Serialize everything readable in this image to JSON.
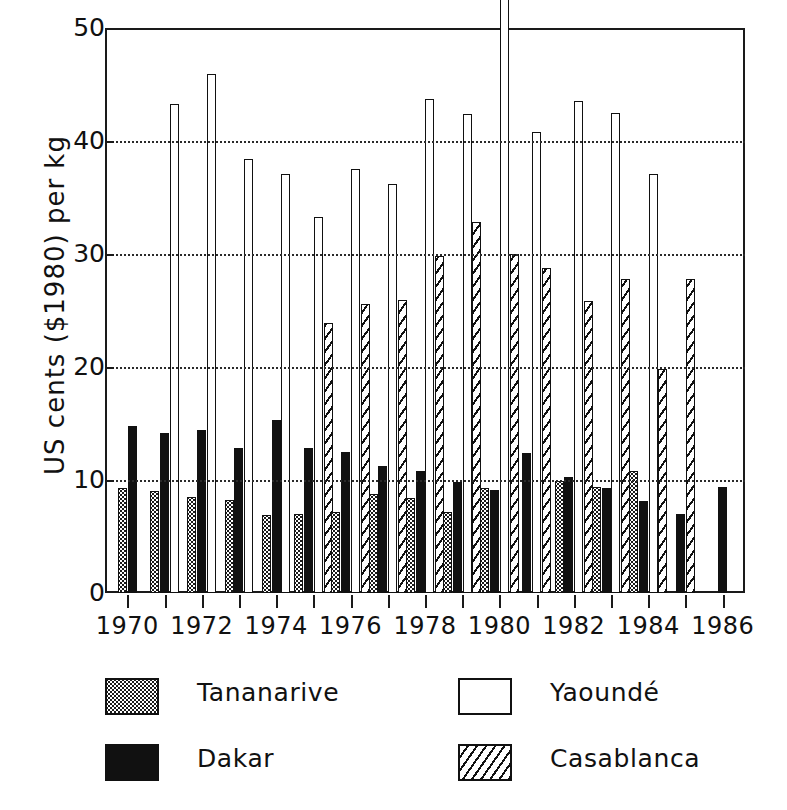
{
  "chart_data": {
    "type": "bar",
    "title": "",
    "subtitle": "",
    "xlabel": "",
    "ylabel": "US cents ($1980) per kg",
    "ylim": [
      0,
      50
    ],
    "yticks": [
      0,
      10,
      20,
      30,
      40,
      50
    ],
    "xlim": [
      1969.4,
      1986.6
    ],
    "xticks": [
      1970,
      1971,
      1972,
      1973,
      1974,
      1975,
      1976,
      1977,
      1978,
      1979,
      1980,
      1981,
      1982,
      1983,
      1984,
      1985,
      1986
    ],
    "xticklabels": [
      "1970",
      "",
      "1972",
      "",
      "1974",
      "",
      "1976",
      "",
      "1978",
      "",
      "1980",
      "",
      "1982",
      "",
      "1984",
      "",
      "1986"
    ],
    "labeled_xticks": [
      "1970",
      "1972",
      "1974",
      "1976",
      "1978",
      "1980",
      "1982",
      "1984",
      "1986"
    ],
    "grid": "horizontal-dotted",
    "legend_position": "below-axes",
    "categories": [
      "1970",
      "1971",
      "1972",
      "1973",
      "1974",
      "1975",
      "1976",
      "1977",
      "1978",
      "1979",
      "1980",
      "1981",
      "1982",
      "1983",
      "1984",
      "1985",
      "1986"
    ],
    "series": [
      {
        "name": "Tananarive",
        "pattern": "dotted",
        "color": "#ffffff",
        "values": [
          9.3,
          9.0,
          8.5,
          8.2,
          6.9,
          7.0,
          7.2,
          8.8,
          8.4,
          7.2,
          9.3,
          null,
          9.9,
          9.4,
          10.8,
          null,
          null
        ]
      },
      {
        "name": "Dakar",
        "pattern": "solid-black",
        "color": "#111111",
        "values": [
          14.8,
          14.2,
          14.4,
          12.8,
          15.3,
          12.8,
          12.5,
          11.2,
          10.8,
          9.8,
          9.1,
          12.4,
          10.3,
          9.3,
          8.1,
          7.0,
          9.4
        ]
      },
      {
        "name": "Yaounde",
        "pattern": "open",
        "color": "#ffffff",
        "values": [
          null,
          43.3,
          45.9,
          38.4,
          37.1,
          33.3,
          37.5,
          36.2,
          43.7,
          42.4,
          53.0,
          40.8,
          43.5,
          42.5,
          37.1,
          null,
          null
        ]
      },
      {
        "name": "Casablanca",
        "pattern": "diagonal-hatch",
        "color": "#ffffff",
        "values": [
          null,
          null,
          null,
          null,
          null,
          23.9,
          25.6,
          25.9,
          29.8,
          32.8,
          30.0,
          28.8,
          25.8,
          27.8,
          19.8,
          27.8,
          null
        ]
      }
    ]
  },
  "legend": {
    "entries": [
      {
        "label": "Tananarive",
        "swatch": "dotted-swatch"
      },
      {
        "label": "Yaounde_display",
        "swatch": "open-swatch"
      },
      {
        "label": "Dakar",
        "swatch": "black-swatch"
      },
      {
        "label": "Casablanca",
        "swatch": "hatched-swatch"
      }
    ],
    "tananarive_label": "Tananarive",
    "yaounde_label": "Yaoundé",
    "dakar_label": "Dakar",
    "casablanca_label": "Casablanca"
  },
  "axis": {
    "ylabel": "US cents ($1980) per kg",
    "y_tick_0": "0",
    "y_tick_10": "10",
    "y_tick_20": "20",
    "y_tick_30": "30",
    "y_tick_40": "40",
    "y_tick_50": "50",
    "x_tick_1970": "1970",
    "x_tick_1972": "1972",
    "x_tick_1974": "1974",
    "x_tick_1976": "1976",
    "x_tick_1978": "1978",
    "x_tick_1980": "1980",
    "x_tick_1982": "1982",
    "x_tick_1984": "1984",
    "x_tick_1986": "1986"
  },
  "colors": {
    "ink": "#111111",
    "background": "#ffffff",
    "grid": "#2a2a2a"
  }
}
